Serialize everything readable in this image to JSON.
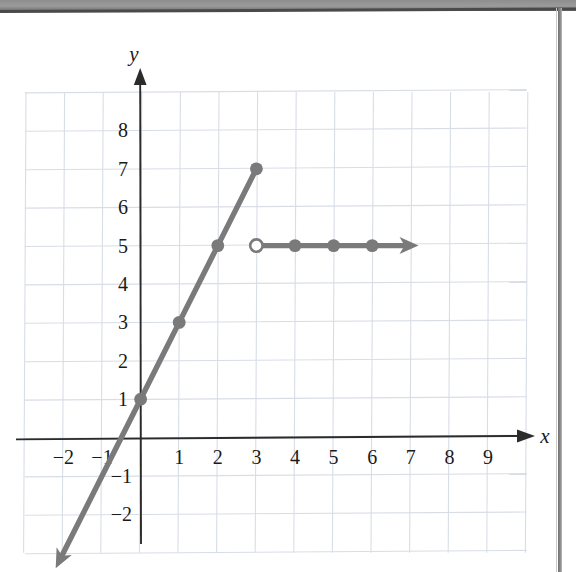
{
  "figure": {
    "kind": "cartesian-graph",
    "axis_labels": {
      "x": "x",
      "y": "y"
    },
    "colors": {
      "curve": "#7a7a7a",
      "axis": "#2b2b2b",
      "grid": "#d8dde6",
      "background": "#ffffff",
      "text": "#1a1a1a"
    }
  },
  "chart_data": {
    "type": "line",
    "title": "",
    "xlabel": "x",
    "ylabel": "y",
    "xlim": [
      -3,
      10
    ],
    "ylim": [
      -3,
      9
    ],
    "grid": true,
    "legend": "none",
    "xticks": [
      -2,
      -1,
      1,
      2,
      3,
      4,
      5,
      6,
      7,
      8,
      9
    ],
    "xtick_labels": [
      "−2",
      "−1",
      "1",
      "2",
      "3",
      "4",
      "5",
      "6",
      "7",
      "8",
      "9"
    ],
    "yticks": [
      8,
      7,
      6,
      5,
      4,
      3,
      2,
      1,
      -1,
      -2
    ],
    "ytick_labels": [
      "8",
      "7",
      "6",
      "5",
      "4",
      "3",
      "2",
      "1",
      "−1",
      "−2"
    ],
    "series": [
      {
        "name": "ray-slope-2",
        "description": "Line of slope 2 through (0,1), arrow to lower left, closed endpoint at (3,7)",
        "equation": "y = 2x + 1, x ≤ 3",
        "line_style": "solid",
        "arrow_start": true,
        "arrow_end": false,
        "endpoint_marker": "closed",
        "x": [
          -2.2,
          0,
          1,
          2,
          3
        ],
        "y": [
          -3.4,
          1,
          3,
          5,
          7
        ],
        "marked_points": [
          {
            "x": 0,
            "y": 1,
            "marker": "closed"
          },
          {
            "x": 1,
            "y": 3,
            "marker": "closed"
          },
          {
            "x": 2,
            "y": 5,
            "marker": "closed"
          },
          {
            "x": 3,
            "y": 7,
            "marker": "closed"
          }
        ]
      },
      {
        "name": "horizontal-ray-y5",
        "description": "Horizontal ray at y = 5 starting open at x = 3 extending right",
        "equation": "y = 5, x > 3",
        "line_style": "solid",
        "arrow_start": false,
        "arrow_end": true,
        "endpoint_marker": "open",
        "x": [
          3,
          4,
          5,
          6,
          7.2
        ],
        "y": [
          5,
          5,
          5,
          5,
          5
        ],
        "marked_points": [
          {
            "x": 3,
            "y": 5,
            "marker": "open"
          },
          {
            "x": 4,
            "y": 5,
            "marker": "closed"
          },
          {
            "x": 5,
            "y": 5,
            "marker": "closed"
          },
          {
            "x": 6,
            "y": 5,
            "marker": "closed"
          }
        ]
      }
    ]
  }
}
